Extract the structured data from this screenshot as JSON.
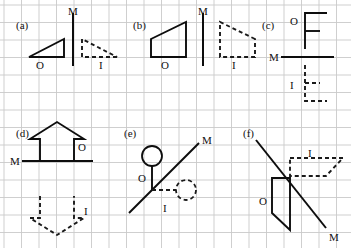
{
  "figure": {
    "width": 351,
    "height": 248,
    "background_color": "#ffffff",
    "grid": {
      "color": "#c9c9c9",
      "spacing_px": 17.5,
      "origin_x": 4,
      "origin_y": 5,
      "cols": 20,
      "rows": 14,
      "visible": true
    },
    "ink": {
      "object_color": "#0d0d0d",
      "image_color": "#1a1a1a",
      "mirror_color": "#0d0d0d",
      "object_style": "solid",
      "image_style": "dashed",
      "dash_pattern": "4,3"
    }
  },
  "labels": {
    "object": "O",
    "image": "I",
    "mirror": "M"
  },
  "panels": [
    {
      "id": "a",
      "label": "(a)",
      "label_x": 16,
      "label_y": 20,
      "mirror_kind": "vertical",
      "mirror": {
        "x1": 73,
        "y1": 13,
        "x2": 73,
        "y2": 66
      },
      "mirror_label": {
        "text": "M",
        "x": 68,
        "y": 6
      },
      "object": {
        "shape": "right-triangle",
        "points": "29,57 64,57 64,39",
        "closed": true
      },
      "object_label": {
        "text": "O",
        "x": 36,
        "y": 60
      },
      "image": {
        "shape": "right-triangle",
        "points": "117,57 82,57 82,39",
        "closed": true
      },
      "image_label": {
        "text": "I",
        "x": 99,
        "y": 60
      }
    },
    {
      "id": "b",
      "label": "(b)",
      "label_x": 133,
      "label_y": 20,
      "mirror_kind": "vertical",
      "mirror": {
        "x1": 203,
        "y1": 13,
        "x2": 203,
        "y2": 66
      },
      "mirror_label": {
        "text": "M",
        "x": 198,
        "y": 6
      },
      "object": {
        "shape": "trapezoid",
        "points": "151,39 186,22 186,57 151,57",
        "closed": true
      },
      "object_label": {
        "text": "O",
        "x": 161,
        "y": 60
      },
      "image": {
        "shape": "trapezoid",
        "points": "255,39 220,22 220,57 255,57",
        "closed": true
      },
      "image_label": {
        "text": "I",
        "x": 232,
        "y": 60
      }
    },
    {
      "id": "c",
      "label": "(c)",
      "label_x": 262,
      "label_y": 20,
      "mirror_kind": "horizontal",
      "mirror": {
        "x1": 281,
        "y1": 57,
        "x2": 334,
        "y2": 57
      },
      "mirror_label": {
        "text": "M",
        "x": 269,
        "y": 52
      },
      "object": {
        "shape": "letter-f",
        "polyline": "305,49 305,13 327,13",
        "arm": "305,31 320,31"
      },
      "object_label": {
        "text": "O",
        "x": 290,
        "y": 16
      },
      "image": {
        "shape": "letter-f",
        "polyline": "305,65 305,101 327,101",
        "arm": "305,83 320,83"
      },
      "image_label": {
        "text": "I",
        "x": 290,
        "y": 80
      }
    },
    {
      "id": "d",
      "label": "(d)",
      "label_x": 16,
      "label_y": 128,
      "mirror_kind": "horizontal",
      "mirror": {
        "x1": 22,
        "y1": 161,
        "x2": 93,
        "y2": 161
      },
      "mirror_label": {
        "text": "M",
        "x": 10,
        "y": 156
      },
      "object": {
        "shape": "up-arrow",
        "points": "40,161 40,139 30,139 57,122 84,139 74,139 74,161",
        "closed": false
      },
      "object_label": {
        "text": "O",
        "x": 78,
        "y": 142
      },
      "image": {
        "shape": "down-arrow",
        "points": "40,196 40,218 30,218 57,235 84,218 74,218 74,196",
        "closed": false
      },
      "image_label": {
        "text": "I",
        "x": 84,
        "y": 206
      }
    },
    {
      "id": "e",
      "label": "(e)",
      "label_x": 124,
      "label_y": 128,
      "mirror_kind": "diagonal",
      "mirror": {
        "x1": 129,
        "y1": 213,
        "x2": 199,
        "y2": 143
      },
      "mirror_label": {
        "text": "M",
        "x": 202,
        "y": 135
      },
      "object": {
        "shape": "lollipop",
        "stem": "152,190 152,166",
        "circle": {
          "cx": 152,
          "cy": 156,
          "r": 10
        }
      },
      "object_label": {
        "text": "O",
        "x": 138,
        "y": 173
      },
      "image": {
        "shape": "lollipop",
        "stem": "152,190 176,190",
        "circle": {
          "cx": 186,
          "cy": 190,
          "r": 10
        }
      },
      "image_label": {
        "text": "I",
        "x": 163,
        "y": 203
      }
    },
    {
      "id": "f",
      "label": "(f)",
      "label_x": 243,
      "label_y": 128,
      "mirror_kind": "diagonal",
      "mirror": {
        "x1": 256,
        "y1": 140,
        "x2": 326,
        "y2": 228
      },
      "mirror_label": {
        "text": "M",
        "x": 329,
        "y": 232
      },
      "object": {
        "shape": "parallelogram",
        "points": "272,178 290,178 290,230 272,213",
        "closed": true
      },
      "object_label": {
        "text": "O",
        "x": 259,
        "y": 196
      },
      "image": {
        "shape": "parallelogram",
        "points": "290,158 343,158 326,176 290,176",
        "closed": true
      },
      "image_label": {
        "text": "I",
        "x": 308,
        "y": 148
      }
    }
  ]
}
